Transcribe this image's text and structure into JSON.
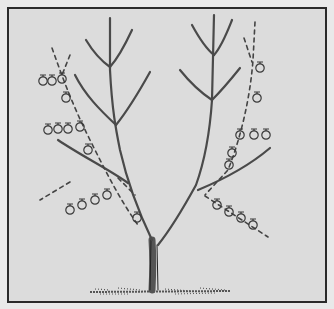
{
  "illustration": {
    "subject": "Pruned fruit tree with two main scaffold branches, fruit spurs and dashed cutting guide lines",
    "colors": {
      "background": "#dcdcdc",
      "outer": "#e9e9e9",
      "frame": "#2a2a2a",
      "ink": "#3a3a3a"
    },
    "elements": {
      "trunk": "trunk",
      "left_leader": "left scaffold branch",
      "right_leader": "right scaffold branch",
      "fruit_clusters": [
        {
          "side": "left",
          "label": "upper-left fruit spur",
          "count": 3
        },
        {
          "side": "left",
          "label": "left dashed branch fruit",
          "count": 2
        },
        {
          "side": "left",
          "label": "middle-left fruit spur",
          "count": 4
        },
        {
          "side": "left",
          "label": "lower-left fruit spur",
          "count": 4
        },
        {
          "side": "right",
          "label": "upper-right dashed fruit",
          "count": 2
        },
        {
          "side": "right",
          "label": "middle-right fruit spur",
          "count": 3
        },
        {
          "side": "right",
          "label": "right dashed fruit",
          "count": 2
        },
        {
          "side": "right",
          "label": "lower-right fruit spur",
          "count": 4
        }
      ],
      "ground": "grass ground line"
    }
  }
}
